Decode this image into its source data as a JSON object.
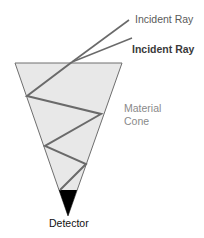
{
  "diagram": {
    "labels": {
      "incident_ray_1": "Incident Ray",
      "incident_ray_2": "Incident Ray",
      "material_line1": "Material",
      "material_line2": "Cone",
      "detector": "Detector"
    },
    "colors": {
      "cone_fill": "#e8e8e8",
      "cone_stroke": "#6e6e6e",
      "ray": "#6a6a6a",
      "detector": "#000000"
    },
    "geometry": {
      "cone_top_left": [
        15,
        63
      ],
      "cone_top_right": [
        122,
        63
      ],
      "cone_apex": [
        68,
        216
      ],
      "detector_top_y": 190,
      "incident_ray_1": [
        [
          129,
          20
        ],
        [
          72,
          62
        ]
      ],
      "incident_ray_2": [
        [
          132,
          38
        ],
        [
          72,
          62
        ]
      ],
      "reflection_path": [
        [
          72,
          62
        ],
        [
          27,
          96
        ],
        [
          101,
          114
        ],
        [
          45,
          146
        ],
        [
          86,
          164
        ],
        [
          60,
          190
        ]
      ]
    }
  }
}
